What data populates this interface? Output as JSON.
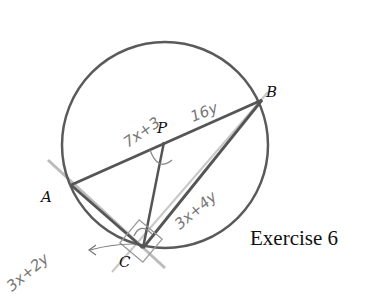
{
  "figure": {
    "caption": "Exercise 6",
    "points": {
      "A": "A",
      "B": "B",
      "C": "C",
      "P": "P"
    },
    "annotations": {
      "arc_PB": "16y",
      "angle_P": "7x+3",
      "arc_CB": "3x+4y",
      "tangent_angle": "3x+2y"
    },
    "colors": {
      "ink": "#5a5a5a",
      "pencil": "#999999",
      "label": "#111111"
    }
  }
}
